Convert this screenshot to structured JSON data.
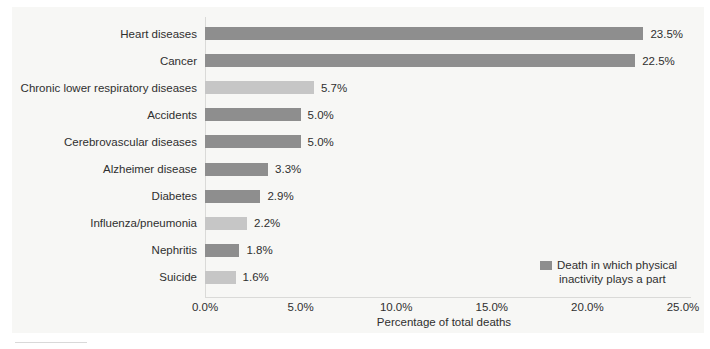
{
  "chart_data": {
    "type": "bar",
    "orientation": "horizontal",
    "title": "",
    "categories": [
      "Heart diseases",
      "Cancer",
      "Chronic lower respiratory diseases",
      "Accidents",
      "Cerebrovascular diseases",
      "Alzheimer disease",
      "Diabetes",
      "Influenza/pneumonia",
      "Nephritis",
      "Suicide"
    ],
    "values": [
      23.5,
      22.5,
      5.7,
      5.0,
      5.0,
      3.3,
      2.9,
      2.2,
      1.8,
      1.6
    ],
    "value_labels": [
      "23.5%",
      "22.5%",
      "5.7%",
      "5.0%",
      "5.0%",
      "3.3%",
      "2.9%",
      "2.2%",
      "1.8%",
      "1.6%"
    ],
    "bar_color_keys": [
      "dark",
      "dark",
      "light",
      "dark",
      "dark",
      "dark",
      "dark",
      "light",
      "dark",
      "light"
    ],
    "colors": {
      "dark": "#8e8e8e",
      "light": "#c6c6c6"
    },
    "xlabel": "Percentage of total deaths",
    "ylabel": "",
    "xlim": [
      0,
      25
    ],
    "grid": false,
    "x_ticks": [
      {
        "value": 0,
        "label": "0.0%"
      },
      {
        "value": 5,
        "label": "5.0%"
      },
      {
        "value": 10,
        "label": "10.0%"
      },
      {
        "value": 15,
        "label": "15.0%"
      },
      {
        "value": 20,
        "label": "20.0%"
      },
      {
        "value": 25,
        "label": "25.0%"
      }
    ],
    "legend": {
      "position": "lower-right",
      "swatch_color": "#8e8e8e",
      "lines": [
        "Death in which physical",
        "inactivity plays a part"
      ]
    }
  }
}
